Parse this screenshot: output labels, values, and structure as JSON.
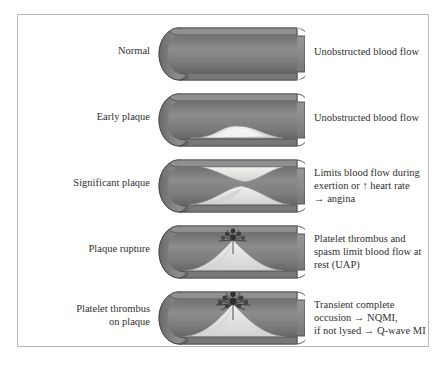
{
  "figure": {
    "border_color": "#b9b9b9",
    "background": "#ffffff"
  },
  "palette": {
    "vessel_wall_dark": "#6e6e6e",
    "vessel_wall_mid": "#858585",
    "lumen_gray": "#7b7b7b",
    "lumen_light": "#9a9a9a",
    "plaque_fill": "#e4e4e2",
    "plaque_shadow": "#c9c9c7",
    "thrombus": "#3a3a3a",
    "outline": "#4a4a4a",
    "text": "#2f2f2f"
  },
  "rows": [
    {
      "id": "normal",
      "label": "Normal",
      "caption": "Unobstructed blood flow",
      "plaque": "none",
      "thrombus": false,
      "vessel_icon": "artery-cross-section-icon"
    },
    {
      "id": "early-plaque",
      "label": "Early plaque",
      "caption": "Unobstructed blood flow",
      "plaque": "low-flat-mound",
      "thrombus": false,
      "vessel_icon": "artery-cross-section-icon"
    },
    {
      "id": "significant-plaque",
      "label": "Significant plaque",
      "caption": "Limits blood flow during exertion or ↑ heart rate → angina",
      "caption_lines": [
        "Limits blood flow during",
        "exertion or ↑ heart rate",
        "→ angina"
      ],
      "plaque": "hourglass-top-and-bottom",
      "thrombus": false,
      "vessel_icon": "artery-cross-section-icon"
    },
    {
      "id": "plaque-rupture",
      "label": "Plaque rupture",
      "caption": "Platelet thrombus and spasm limit blood flow at rest (UAP)",
      "caption_lines": [
        "Platelet thrombus and",
        "spasm limit blood flow at",
        "rest (UAP)"
      ],
      "plaque": "tall-peak",
      "thrombus": true,
      "thrombus_size": "small",
      "vessel_icon": "artery-cross-section-icon"
    },
    {
      "id": "platelet-thrombus-on-plaque",
      "label": "Platelet thrombus on plaque",
      "label_lines": [
        "Platelet thrombus",
        "on plaque"
      ],
      "caption": "Transient complete occusion → NQMI, if not lysed → Q-wave MI",
      "caption_lines": [
        "Transient complete",
        "occusion → NQMI,",
        "if not lysed → Q-wave MI"
      ],
      "plaque": "tall-peak",
      "thrombus": true,
      "thrombus_size": "large",
      "vessel_icon": "artery-cross-section-icon"
    }
  ]
}
